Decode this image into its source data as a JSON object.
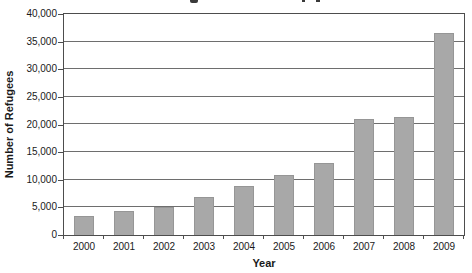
{
  "chart_data": {
    "type": "bar",
    "title": "",
    "xlabel": "Year",
    "ylabel": "Number of Refugees",
    "categories": [
      "2000",
      "2001",
      "2002",
      "2003",
      "2004",
      "2005",
      "2006",
      "2007",
      "2008",
      "2009"
    ],
    "values": [
      3400,
      4300,
      5100,
      6800,
      8900,
      10900,
      13100,
      21000,
      21300,
      36500
    ],
    "ylim": [
      0,
      40000
    ],
    "ytick_step": 5000,
    "ytick_labels": [
      "0",
      "5,000",
      "10,000",
      "15,000",
      "20,000",
      "25,000",
      "30,000",
      "35,000",
      "40,000"
    ],
    "grid": true,
    "legend": "none",
    "colors": {
      "bar": "#a8a8a8",
      "bar_border": "#969696",
      "grid": "#6e6e6e",
      "axis": "#4d4d4d",
      "text": "#1a1a1a",
      "background": "#ffffff"
    }
  }
}
